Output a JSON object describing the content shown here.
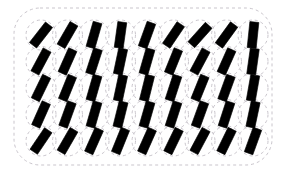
{
  "stimulus": {
    "title": "Tilted Bar Orientation Array",
    "canvas": {
      "width": 285,
      "height": 182,
      "background_color": "#ffffff"
    },
    "frame": {
      "name": "dashed-rounded-rectangle-border",
      "x": 14,
      "y": 8,
      "width": 258,
      "height": 157,
      "corner_radius": 26,
      "stroke_color": "#c9c5cc",
      "stroke_width": 1,
      "dash_pattern": "3 3",
      "fill": "none"
    },
    "lattice": {
      "columns": 9,
      "rows": 5,
      "origin_x": 41,
      "origin_y": 35,
      "spacing_x": 26.5,
      "spacing_y": 26.5,
      "circle": {
        "name": "dashed-placement-circle",
        "radius": 15,
        "stroke_color": "#c9c5cc",
        "stroke_width": 1,
        "dash_pattern": "3 3",
        "fill": "none"
      },
      "bar": {
        "name": "black-oriented-bar",
        "length": 26,
        "width": 9,
        "fill_color": "#000000",
        "stroke_color": "#000000",
        "stroke_width": 0.6
      }
    },
    "orientations_deg": [
      [
        38,
        30,
        16,
        8,
        20,
        34,
        42,
        36,
        6
      ],
      [
        28,
        24,
        18,
        12,
        16,
        22,
        28,
        24,
        8
      ],
      [
        26,
        22,
        16,
        12,
        14,
        18,
        22,
        20,
        10
      ],
      [
        24,
        20,
        16,
        14,
        16,
        18,
        20,
        18,
        12
      ],
      [
        34,
        30,
        24,
        22,
        24,
        26,
        28,
        26,
        20
      ]
    ],
    "legend": {
      "bar_count": 45,
      "circle_count": 45
    }
  }
}
